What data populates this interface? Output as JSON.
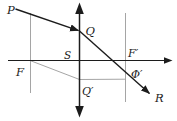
{
  "diagram": {
    "type": "optics-ray-construction",
    "labels": {
      "P": "P",
      "Q": "Q",
      "S": "S",
      "F_prime": "F′",
      "F": "F",
      "Q_prime": "Q′",
      "Phi_prime": "Φ′",
      "R": "R"
    },
    "colors": {
      "main_lines": "#1c1c1c",
      "construction_lines": "#9b9b9b",
      "background": "#ffffff"
    }
  }
}
